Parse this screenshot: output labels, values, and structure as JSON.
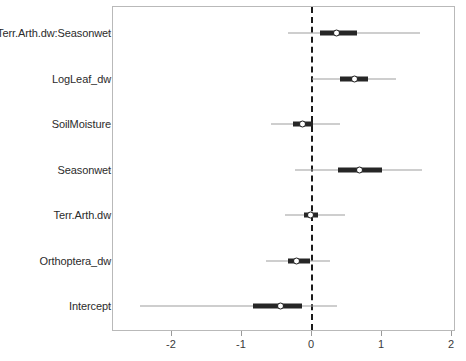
{
  "chart_data": {
    "type": "scatter",
    "title": "",
    "xlabel": "",
    "ylabel": "",
    "xlim": [
      -2.85,
      2.06
    ],
    "ylim": [
      0,
      7
    ],
    "grid": false,
    "legend": null,
    "reference_line": {
      "x": 0,
      "style": "dashed",
      "color": "#1a1a1a"
    },
    "xticks": [
      -2,
      -1,
      0,
      1,
      2
    ],
    "xticklabels": [
      "-2",
      "-1",
      "0",
      "1",
      "2"
    ],
    "categories": [
      "Terr.Arth.dw:Seasonwet",
      "LogLeaf_dw",
      "SoilMoisture",
      "Seasonwet",
      "Terr.Arth.dw",
      "Orthoptera_dw",
      "Intercept"
    ],
    "series": [
      {
        "name": "coefficient estimates with inner and outer credible intervals",
        "points": [
          {
            "label": "Terr.Arth.dw:Seasonwet",
            "estimate": 0.37,
            "inner_low": 0.13,
            "inner_high": 0.66,
            "outer_low": -0.33,
            "outer_high": 1.56
          },
          {
            "label": "LogLeaf_dw",
            "estimate": 0.63,
            "inner_low": 0.41,
            "inner_high": 0.81,
            "outer_low": 0.02,
            "outer_high": 1.22
          },
          {
            "label": "SoilMoisture",
            "estimate": -0.11,
            "inner_low": -0.26,
            "inner_high": 0.03,
            "outer_low": -0.57,
            "outer_high": 0.41
          },
          {
            "label": "Seasonwet",
            "estimate": 0.7,
            "inner_low": 0.39,
            "inner_high": 1.01,
            "outer_low": -0.23,
            "outer_high": 1.59
          },
          {
            "label": "Terr.Arth.dw",
            "estimate": 0.0,
            "inner_low": -0.1,
            "inner_high": 0.1,
            "outer_low": -0.37,
            "outer_high": 0.49
          },
          {
            "label": "Orthoptera_dw",
            "estimate": -0.2,
            "inner_low": -0.33,
            "inner_high": -0.01,
            "outer_low": -0.64,
            "outer_high": 0.27
          },
          {
            "label": "Intercept",
            "estimate": -0.43,
            "inner_low": -0.83,
            "inner_high": -0.13,
            "outer_low": -2.44,
            "outer_high": 0.37
          }
        ]
      }
    ],
    "colors": {
      "point_fill": "#ffffff",
      "point_edge": "#1a1a1a",
      "inner_interval": "#262626",
      "outer_interval": "#9d9d9d",
      "frame": "#b9b9b9",
      "reference_line": "#1a1a1a",
      "text": "#2b2b2b"
    }
  }
}
